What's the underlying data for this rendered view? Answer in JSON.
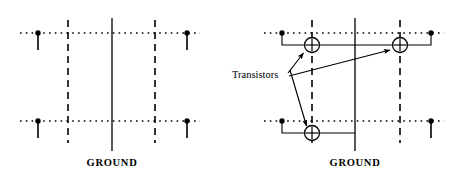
{
  "figure": {
    "background_color": "#ffffff",
    "ink_color": "#000000",
    "width": 460,
    "height": 176
  },
  "panels": [
    {
      "id": "left",
      "name": "routing-channel-without-transistors",
      "ground_label": "GROUND",
      "ground_rail": {
        "x": 112,
        "y_top": 18,
        "y_bottom": 151,
        "style": "solid"
      },
      "dashed_rails": [
        {
          "x": 68,
          "y_top": 20,
          "y_bottom": 143,
          "style": "dashed"
        },
        {
          "x": 155,
          "y_top": 20,
          "y_bottom": 143,
          "style": "dashed"
        }
      ],
      "dotted_rows": [
        {
          "y": 33,
          "x_start": 20,
          "x_end": 200,
          "style": "dotted"
        },
        {
          "y": 121,
          "x_start": 20,
          "x_end": 200,
          "style": "dotted"
        }
      ],
      "pins": [
        {
          "x": 38,
          "y": 33,
          "direction": "down",
          "length": 17
        },
        {
          "x": 187,
          "y": 33,
          "direction": "down",
          "length": 17
        },
        {
          "x": 38,
          "y": 121,
          "direction": "down",
          "length": 17
        },
        {
          "x": 187,
          "y": 121,
          "direction": "down",
          "length": 17
        }
      ],
      "transistors": []
    },
    {
      "id": "right",
      "name": "routing-channel-with-transistors",
      "ground_label": "GROUND",
      "ground_rail": {
        "x": 355,
        "y_top": 18,
        "y_bottom": 151,
        "style": "solid"
      },
      "dashed_rails": [
        {
          "x": 312,
          "y_top": 20,
          "y_bottom": 143,
          "style": "dashed"
        },
        {
          "x": 400,
          "y_top": 20,
          "y_bottom": 143,
          "style": "dashed"
        }
      ],
      "dotted_rows": [
        {
          "y": 33,
          "x_start": 264,
          "x_end": 444,
          "style": "dotted"
        },
        {
          "y": 121,
          "x_start": 264,
          "x_end": 444,
          "style": "dotted"
        }
      ],
      "pins": [
        {
          "x": 282,
          "y": 33,
          "direction": "down",
          "length": 0
        },
        {
          "x": 431,
          "y": 33,
          "direction": "down",
          "length": 0
        },
        {
          "x": 282,
          "y": 121,
          "direction": "down",
          "length": 0
        },
        {
          "x": 431,
          "y": 121,
          "direction": "down",
          "length": 17
        }
      ],
      "transistors": [
        {
          "id": "t-upper-left",
          "x": 312,
          "y": 45,
          "radius": 7.5,
          "symbol": "circle-cross"
        },
        {
          "id": "t-upper-right",
          "x": 400,
          "y": 45,
          "radius": 7.5,
          "symbol": "circle-cross"
        },
        {
          "id": "t-lower-left",
          "x": 312,
          "y": 133,
          "radius": 7.5,
          "symbol": "circle-cross"
        }
      ],
      "nets": [
        {
          "id": "upper-net",
          "points": "282,33 282,45 400,45 431,45 431,33"
        },
        {
          "id": "lower-net",
          "points": "282,121 282,133 355,133"
        }
      ],
      "callout": {
        "label": "Transistors",
        "text_x": 232,
        "text_y": 75,
        "leaders": [
          {
            "id": "leader-upper-left",
            "from_x": 288,
            "from_y": 73,
            "to_x": 305,
            "to_y": 52
          },
          {
            "id": "leader-upper-right",
            "from_x": 289,
            "from_y": 76,
            "to_x": 392,
            "to_y": 50
          },
          {
            "id": "leader-lower-left",
            "from_x": 290,
            "from_y": 70,
            "to_x": 308,
            "to_y": 127
          }
        ]
      }
    }
  ],
  "labels": {
    "ground_left": "GROUND",
    "ground_right": "GROUND",
    "callout_transistors": "Transistors"
  },
  "label_positions": {
    "ground_left": {
      "x": 112,
      "y": 166
    },
    "ground_right": {
      "x": 355,
      "y": 166
    },
    "callout_transistors": {
      "x": 232,
      "y": 75
    }
  }
}
